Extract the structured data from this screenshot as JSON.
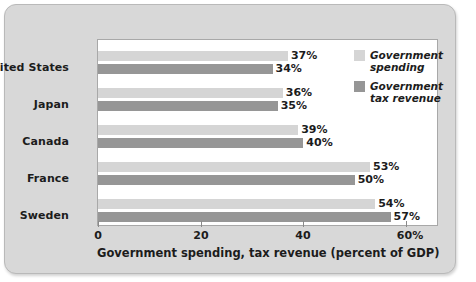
{
  "chart_data": {
    "type": "bar",
    "orientation": "horizontal",
    "title": "",
    "xlabel": "Government spending, tax revenue (percent of GDP)",
    "ylabel": "",
    "xlim": [
      0,
      60
    ],
    "xticks": [
      0,
      20,
      40,
      60
    ],
    "xtick_labels": [
      "0",
      "20",
      "40",
      "60%"
    ],
    "grid": false,
    "legend_position": "inside-right",
    "categories": [
      "United States",
      "Japan",
      "Canada",
      "France",
      "Sweden"
    ],
    "series": [
      {
        "name": "Government spending",
        "color": "#d5d5d5",
        "values": [
          37,
          36,
          39,
          53,
          54
        ],
        "value_labels": [
          "37%",
          "36%",
          "39%",
          "53%",
          "54%"
        ]
      },
      {
        "name": "Government tax revenue",
        "color": "#969696",
        "values": [
          34,
          35,
          40,
          50,
          57
        ],
        "value_labels": [
          "34%",
          "35%",
          "40%",
          "50%",
          "57%"
        ]
      }
    ]
  },
  "legend": {
    "items": [
      {
        "label": "Government\nspending",
        "swatch": "spending"
      },
      {
        "label": "Government\ntax revenue",
        "swatch": "revenue"
      }
    ]
  },
  "colors": {
    "panel_background": "#d8d8d8",
    "plot_background": "#ffffff",
    "spending_bar": "#d5d5d5",
    "revenue_bar": "#969696",
    "text": "#1c1c1c"
  }
}
